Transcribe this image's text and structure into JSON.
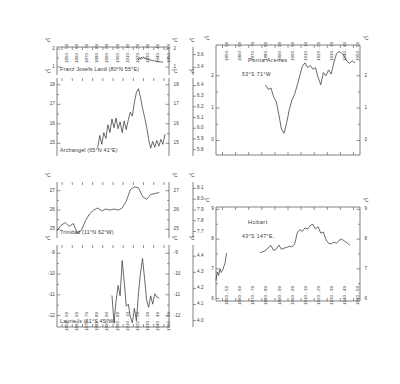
{
  "figure": {
    "width": 400,
    "height": 384,
    "background": "#ffffff",
    "ink": "#3a3a3a",
    "degree_unit": "°C"
  },
  "decades": [
    "1850 - 59",
    "1860 - 69",
    "1870 - 79",
    "1880 - 89",
    "1890 - 99",
    "1900 - 09",
    "1910 - 19",
    "1920 - 29",
    "1930 - 39",
    "1940 - 49",
    "1950 - 59"
  ],
  "chart_data": [
    {
      "type": "line",
      "title": "Franz Josefs  Land (80°N 55°E)",
      "station": "Franz Josefs Land",
      "latitude": "80°N",
      "longitude": "55°E",
      "xlabel": "",
      "ylabel": "°C",
      "categories": [
        "1850 - 59",
        "1860 - 69",
        "1870 - 79",
        "1880 - 89",
        "1890 - 99",
        "1900 - 09",
        "1910 - 19",
        "1920 - 29",
        "1930 - 39",
        "1940 - 49",
        "1950 - 59"
      ],
      "grid": false,
      "left_axis": {
        "unit": "°C",
        "ticks": [
          1,
          2
        ],
        "ylim": [
          0.55,
          2.12
        ]
      },
      "right_axis": {
        "unit": "°C",
        "ticks": [
          1,
          2
        ],
        "ylim": [
          0.55,
          2.12
        ]
      },
      "far_right_axis": {
        "unit": "%",
        "ticks": [
          3.4,
          3.6
        ],
        "ylim": [
          3.28,
          3.72
        ]
      },
      "x": [
        1930,
        1931,
        1932,
        1933,
        1934,
        1935,
        1936,
        1937,
        1938,
        1939,
        1940,
        1941,
        1942,
        1943,
        1944,
        1945,
        1946,
        1947,
        1948,
        1949,
        1950,
        1951,
        1952,
        1953,
        1954
      ],
      "values": [
        1.4,
        1.52,
        1.43,
        1.55,
        1.47,
        1.57,
        1.46,
        1.52,
        1.42,
        1.48,
        1.38,
        1.44,
        1.36,
        1.4,
        1.33,
        1.38,
        1.31,
        1.35,
        1.29,
        1.33,
        1.28,
        1.31,
        1.27,
        1.3,
        1.27
      ]
    },
    {
      "type": "line",
      "title": "Archangel (65°N 41°E)",
      "station": "Archangel",
      "latitude": "65°N",
      "longitude": "41°E",
      "xlabel": "",
      "ylabel": "°C",
      "categories": [
        "1850 - 59",
        "1860 - 69",
        "1870 - 79",
        "1880 - 89",
        "1890 - 99",
        "1900 - 09",
        "1910 - 19",
        "1920 - 29",
        "1930 - 39",
        "1940 - 49",
        "1950 - 59"
      ],
      "grid": false,
      "left_axis": {
        "unit": "°C",
        "ticks": [
          15,
          16,
          17,
          18
        ],
        "ylim": [
          14.35,
          18.35
        ]
      },
      "right_axis": {
        "unit": "°C",
        "ticks": [
          15,
          16,
          17,
          18
        ],
        "ylim": [
          14.35,
          18.35
        ]
      },
      "far_right_axis": {
        "unit": "%",
        "ticks": [
          5.8,
          5.9,
          6.0,
          6.1,
          6.2,
          6.3,
          6.4
        ],
        "ylim": [
          5.74,
          6.47
        ]
      },
      "x": [
        1890,
        1892,
        1894,
        1896,
        1898,
        1900,
        1902,
        1904,
        1906,
        1908,
        1910,
        1912,
        1914,
        1916,
        1918,
        1920,
        1922,
        1924,
        1926,
        1928,
        1930,
        1932,
        1934,
        1936,
        1938,
        1940,
        1942,
        1944,
        1946,
        1948,
        1950,
        1952,
        1954,
        1956
      ],
      "values": [
        14.8,
        15.4,
        14.95,
        15.55,
        15.25,
        15.95,
        15.55,
        16.25,
        15.8,
        16.3,
        15.75,
        16.1,
        15.55,
        16.15,
        15.7,
        16.2,
        16.6,
        16.4,
        17.1,
        17.6,
        17.8,
        17.35,
        16.8,
        16.35,
        15.85,
        15.2,
        14.75,
        15.1,
        14.8,
        15.15,
        14.85,
        15.2,
        14.95,
        15.45
      ]
    },
    {
      "type": "line",
      "title": "Trinidad (11°N 62°W)",
      "station": "Trinidad",
      "latitude": "11°N",
      "longitude": "62°W",
      "xlabel": "",
      "ylabel": "°C",
      "categories": [
        "1850 - 59",
        "1860 - 69",
        "1870 - 79",
        "1880 - 89",
        "1890 - 99",
        "1900 - 09",
        "1910 - 19",
        "1920 - 29",
        "1930 - 39",
        "1940 - 49",
        "1950 - 59"
      ],
      "grid": false,
      "left_axis": {
        "unit": "°C",
        "ticks": [
          25,
          26,
          27
        ],
        "ylim": [
          24.55,
          27.45
        ]
      },
      "right_axis": {
        "unit": "°C",
        "ticks": [
          25,
          26,
          27
        ],
        "ylim": [
          24.55,
          27.45
        ]
      },
      "far_right_axis": {
        "unit": "%",
        "ticks": [
          7.7,
          7.8,
          7.9,
          8.0,
          8.1
        ],
        "ylim": [
          7.64,
          8.16
        ]
      },
      "x": [
        1850,
        1854,
        1858,
        1862,
        1866,
        1870,
        1874,
        1878,
        1882,
        1886,
        1890,
        1894,
        1898,
        1902,
        1906,
        1910,
        1914,
        1918,
        1922,
        1926,
        1930,
        1934,
        1938,
        1942,
        1946,
        1950
      ],
      "values": [
        24.95,
        25.2,
        25.35,
        25.15,
        25.3,
        24.8,
        24.95,
        25.45,
        25.8,
        26.0,
        26.1,
        25.95,
        26.05,
        26.0,
        26.05,
        26.0,
        26.1,
        26.45,
        27.05,
        27.2,
        27.15,
        26.7,
        26.55,
        26.8,
        26.85,
        26.9
      ]
    },
    {
      "type": "line",
      "title": "Laurie Is (61°S 45°W)",
      "station": "Laurie Is",
      "latitude": "61°S",
      "longitude": "45°W",
      "xlabel": "",
      "ylabel": "°C",
      "categories": [
        "1850 - 59",
        "1860 - 69",
        "1870 - 79",
        "1880 - 89",
        "1890 - 99",
        "1900 - 09",
        "1910 - 19",
        "1920 - 29",
        "1930 - 39",
        "1940 - 49",
        "1950 - 59"
      ],
      "grid": false,
      "left_axis": {
        "unit": "°C",
        "ticks": [
          -12,
          -11,
          -10,
          -9
        ],
        "ylim": [
          -12.55,
          -8.6
        ]
      },
      "right_axis": {
        "unit": "°C",
        "ticks": [
          -12,
          -11,
          -10,
          -9
        ],
        "ylim": [
          -12.55,
          -8.6
        ]
      },
      "far_right_axis": {
        "unit": "%",
        "ticks": [
          4.0,
          4.1,
          4.2,
          4.3,
          4.4
        ],
        "ylim": [
          3.96,
          4.47
        ]
      },
      "x": [
        1904,
        1906,
        1908,
        1910,
        1912,
        1914,
        1916,
        1918,
        1920,
        1922,
        1924,
        1926,
        1928,
        1930,
        1932,
        1934,
        1936,
        1938,
        1940,
        1942,
        1944,
        1946,
        1948,
        1950
      ],
      "values": [
        -11.05,
        -12.35,
        -11.3,
        -10.55,
        -11.05,
        -9.35,
        -10.35,
        -11.55,
        -11.45,
        -12.05,
        -12.35,
        -11.65,
        -12.25,
        -10.95,
        -9.95,
        -9.25,
        -10.2,
        -11.25,
        -11.6,
        -11.05,
        -11.45,
        -10.95,
        -11.1,
        -11.15
      ]
    },
    {
      "type": "line",
      "title": "Punta  Arenas",
      "station": "Punta Arenas",
      "latitude": "53°S",
      "longitude": "71°W",
      "coords": "53°S   71°W",
      "xlabel": "",
      "ylabel": "°C",
      "categories": [
        "1850 - 59",
        "1860 - 69",
        "1870 - 79",
        "1880 - 89",
        "1890 - 99",
        "1900 - 09",
        "1910 - 19",
        "1920 - 29",
        "1930 - 39",
        "1940 - 49",
        "1950 - 59"
      ],
      "grid": false,
      "left_axis": {
        "unit": "°C",
        "ticks": [
          0,
          1,
          2
        ],
        "ylim": [
          -0.45,
          2.95
        ]
      },
      "right_axis": {
        "unit": "°C",
        "ticks": [
          0,
          1,
          2
        ],
        "ylim": [
          -0.45,
          2.95
        ]
      },
      "x": [
        1888,
        1890,
        1892,
        1894,
        1896,
        1898,
        1900,
        1902,
        1904,
        1906,
        1908,
        1910,
        1912,
        1914,
        1916,
        1918,
        1920,
        1922,
        1924,
        1926,
        1928,
        1930,
        1932,
        1934,
        1936,
        1938,
        1940,
        1942,
        1944,
        1946,
        1948,
        1950,
        1952,
        1954,
        1956
      ],
      "values": [
        1.7,
        1.58,
        1.62,
        1.35,
        1.2,
        0.8,
        0.35,
        0.22,
        0.55,
        0.95,
        1.25,
        1.42,
        1.7,
        2.0,
        2.3,
        2.4,
        2.25,
        2.32,
        2.2,
        2.25,
        1.95,
        1.72,
        2.1,
        2.0,
        2.18,
        2.05,
        2.4,
        2.68,
        2.75,
        2.7,
        2.6,
        2.45,
        2.38,
        2.46,
        2.4
      ]
    },
    {
      "type": "line",
      "title": "Hobart",
      "station": "Hobart",
      "latitude": "43°S",
      "longitude": "147°E",
      "coords": "43°S   147°E.",
      "xlabel": "",
      "ylabel": "°C",
      "categories": [
        "1850 - 59",
        "1860 - 69",
        "1870 - 79",
        "1880 - 89",
        "1890 - 99",
        "1900 - 09",
        "1910 - 19",
        "1920 - 29",
        "1930 - 39",
        "1940 - 49",
        "1950 - 59"
      ],
      "grid": false,
      "left_axis": {
        "unit": "°C",
        "ticks": [
          6,
          7,
          8,
          9
        ],
        "ylim": [
          5.92,
          9.08
        ]
      },
      "right_axis": {
        "unit": "°C",
        "ticks": [
          6,
          7,
          8,
          9
        ],
        "ylim": [
          5.92,
          9.08
        ]
      },
      "segments": [
        {
          "x": [
            1850,
            1851,
            1852,
            1853,
            1854,
            1855,
            1856,
            1857,
            1858
          ],
          "values": [
            6.62,
            6.9,
            6.78,
            7.0,
            6.88,
            6.95,
            7.08,
            7.2,
            7.52
          ]
        },
        {
          "x": [
            1884,
            1886,
            1888,
            1890,
            1892,
            1894,
            1896,
            1898,
            1900,
            1902,
            1904,
            1906,
            1908,
            1910,
            1912,
            1914,
            1916,
            1918,
            1920,
            1922,
            1924,
            1926,
            1928,
            1930,
            1932,
            1934,
            1936,
            1938,
            1940,
            1942,
            1944,
            1946,
            1948,
            1950,
            1952
          ],
          "values": [
            7.55,
            7.58,
            7.62,
            7.72,
            7.78,
            7.62,
            7.66,
            7.8,
            7.66,
            7.7,
            7.72,
            7.76,
            7.74,
            7.82,
            8.2,
            8.32,
            8.26,
            8.38,
            8.34,
            8.46,
            8.5,
            8.34,
            8.42,
            8.2,
            8.24,
            7.98,
            7.86,
            7.84,
            7.9,
            7.86,
            7.96,
            8.0,
            7.94,
            7.88,
            7.8
          ]
        }
      ]
    }
  ]
}
